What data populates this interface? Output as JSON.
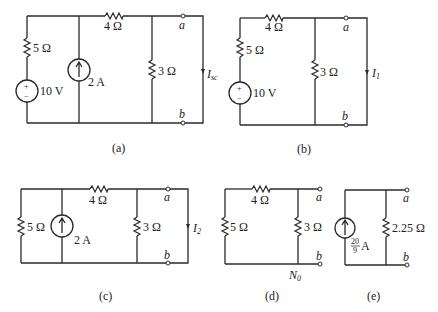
{
  "figure": {
    "panels": [
      {
        "id": "a",
        "caption": "(a)",
        "components": {
          "r_series": "5 Ω",
          "r_top": "4 Ω",
          "r_shunt": "3 Ω",
          "voltage_source": "10 V",
          "current_source": "2 A",
          "current_label_main": "I",
          "current_label_sub": "sc"
        },
        "terminals": {
          "top": "a",
          "bottom": "b"
        }
      },
      {
        "id": "b",
        "caption": "(b)",
        "components": {
          "r_series": "5 Ω",
          "r_top": "4 Ω",
          "r_shunt": "3 Ω",
          "voltage_source": "10 V",
          "current_label_main": "I",
          "current_label_sub": "1"
        },
        "terminals": {
          "top": "a",
          "bottom": "b"
        }
      },
      {
        "id": "c",
        "caption": "(c)",
        "components": {
          "r_left": "5 Ω",
          "r_top": "4 Ω",
          "r_shunt": "3 Ω",
          "current_source": "2 A",
          "current_label_main": "I",
          "current_label_sub": "2"
        },
        "terminals": {
          "top": "a",
          "bottom": "b"
        }
      },
      {
        "id": "d",
        "caption": "(d)",
        "components": {
          "r_left": "5 Ω",
          "r_top": "4 Ω",
          "r_shunt": "3 Ω",
          "network_label_main": "N",
          "network_label_sub": "0"
        },
        "terminals": {
          "top": "a",
          "bottom": "b"
        }
      },
      {
        "id": "e",
        "caption": "(e)",
        "components": {
          "current_source_num": "20",
          "current_source_den": "9",
          "current_source_unit": "A",
          "r_shunt": "2.25 Ω"
        },
        "terminals": {
          "top": "a",
          "bottom": "b"
        }
      }
    ],
    "source_plus": "+",
    "source_minus": "−"
  }
}
